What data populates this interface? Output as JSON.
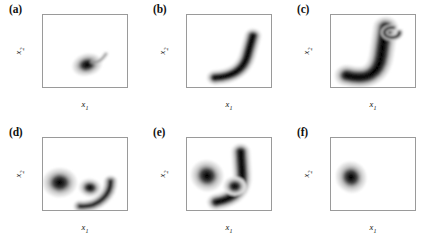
{
  "figure": {
    "type": "contour-density-grid",
    "rows": 2,
    "cols": 3,
    "background": "#ffffff",
    "colormap": "grayscale",
    "frame_color": "#9a9a9a"
  },
  "axis": {
    "xlabel": "x",
    "xlabel_sub": "1",
    "ylabel": "x",
    "ylabel_sub": "2",
    "xlim": [
      -1,
      1
    ],
    "ylim": [
      -3,
      2
    ],
    "xticks": [
      "-1",
      "-0.5",
      "0",
      "0.5",
      "1"
    ],
    "xtick_values": [
      -1,
      -0.5,
      0,
      0.5,
      1
    ],
    "yticks": [
      "2",
      "1",
      "0",
      "-1",
      "-2",
      "-3"
    ],
    "ytick_values": [
      2,
      1,
      0,
      -1,
      -2,
      -3
    ],
    "grid": false
  },
  "chart_data": {
    "type": "heatmap",
    "title": "",
    "xlabel": "x1",
    "ylabel": "x2",
    "xlim": [
      -1,
      1
    ],
    "ylim": [
      -3,
      2
    ],
    "grid": false,
    "legend": "none",
    "colormap": "grayscale-contour",
    "panels": [
      {
        "label": "(a)",
        "description": "compact teardrop blob with thin tail sweeping to upper-right",
        "peak": [
          0.08,
          -1.45
        ],
        "features": [
          {
            "kind": "blob",
            "center": [
              0.05,
              -1.45
            ],
            "rx": 0.16,
            "ry": 0.33,
            "rotation": -25,
            "intensity": 1.0
          },
          {
            "kind": "tail",
            "from": [
              0.18,
              -1.25
            ],
            "to": [
              0.5,
              -0.7
            ],
            "intensity": 0.35
          }
        ]
      },
      {
        "label": "(b)",
        "description": "thin banana-shaped crescent from lower-left to upper-right",
        "peak": [
          0.5,
          -1.6
        ],
        "features": [
          {
            "kind": "arc",
            "start": [
              -0.33,
              -2.35
            ],
            "mid": [
              0.3,
              -2.25
            ],
            "end": [
              0.57,
              0.55
            ],
            "width": 0.18,
            "intensity": 1.0
          }
        ]
      },
      {
        "label": "(c)",
        "description": "large open C-shaped crescent with curled inward upper tip",
        "peak": [
          0.55,
          -1.0
        ],
        "features": [
          {
            "kind": "arc",
            "start": [
              -0.62,
              -2.2
            ],
            "mid": [
              0.1,
              -2.75
            ],
            "end": [
              0.3,
              1.15
            ],
            "width": 0.26,
            "intensity": 1.0
          },
          {
            "kind": "curl",
            "center": [
              0.45,
              0.9
            ],
            "intensity": 0.8
          }
        ]
      },
      {
        "label": "(d)",
        "description": "spiral whorl: outer C-band enclosing two nested inner lobes",
        "peak": [
          -0.6,
          -1.05
        ],
        "features": [
          {
            "kind": "outer-band",
            "center": [
              -0.05,
              -1.0
            ],
            "rx": 0.66,
            "ry": 1.75,
            "intensity": 0.95
          },
          {
            "kind": "inner-lobe",
            "center": [
              -0.6,
              -1.1
            ],
            "rx": 0.18,
            "ry": 0.45,
            "rotation": -30,
            "intensity": 1.0
          },
          {
            "kind": "inner-lobe",
            "center": [
              0.12,
              -1.45
            ],
            "rx": 0.12,
            "ry": 0.28,
            "rotation": 20,
            "intensity": 0.9
          }
        ]
      },
      {
        "label": "(e)",
        "description": "separated left concentric blob plus right crescent with attached nodule",
        "peak": [
          -0.52,
          -0.62
        ],
        "features": [
          {
            "kind": "blob",
            "center": [
              -0.52,
              -0.62
            ],
            "rx": 0.17,
            "ry": 0.48,
            "rotation": -10,
            "intensity": 1.0
          },
          {
            "kind": "arc",
            "start": [
              -0.3,
              -2.45
            ],
            "mid": [
              0.35,
              -2.1
            ],
            "end": [
              0.28,
              1.05
            ],
            "width": 0.2,
            "intensity": 0.95
          },
          {
            "kind": "nodule",
            "center": [
              0.14,
              -1.35
            ],
            "rx": 0.12,
            "ry": 0.3,
            "intensity": 0.95
          }
        ]
      },
      {
        "label": "(f)",
        "description": "single compact concentric blob, remainder of domain empty",
        "peak": [
          -0.52,
          -0.72
        ],
        "features": [
          {
            "kind": "blob",
            "center": [
              -0.52,
              -0.72
            ],
            "rx": 0.16,
            "ry": 0.48,
            "rotation": -8,
            "intensity": 1.0
          }
        ]
      }
    ]
  }
}
